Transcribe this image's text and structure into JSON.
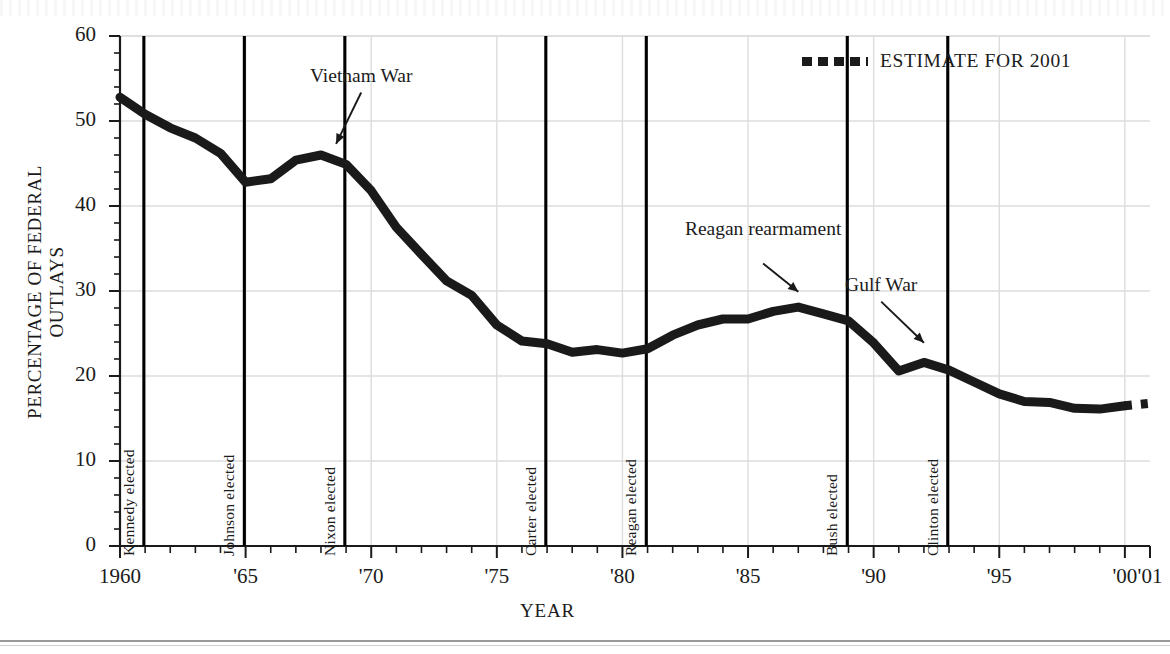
{
  "chart_data": {
    "type": "line",
    "title": "",
    "xlabel": "YEAR",
    "ylabel": "PERCENTAGE OF FEDERAL OUTLAYS",
    "xlim": [
      1960,
      2001
    ],
    "ylim": [
      0,
      60
    ],
    "grid": true,
    "legend_position": "top-right",
    "series": [
      {
        "name": "Defense share of federal outlays",
        "style": "solid",
        "x": [
          1960,
          1961,
          1962,
          1963,
          1964,
          1965,
          1966,
          1967,
          1968,
          1969,
          1970,
          1971,
          1972,
          1973,
          1974,
          1975,
          1976,
          1977,
          1978,
          1979,
          1980,
          1981,
          1982,
          1983,
          1984,
          1985,
          1986,
          1987,
          1988,
          1989,
          1990,
          1991,
          1992,
          1993,
          1994,
          1995,
          1996,
          1997,
          1998,
          1999,
          2000
        ],
        "values": [
          52.8,
          50.8,
          49.2,
          48.0,
          46.2,
          42.8,
          43.2,
          45.4,
          46.0,
          44.9,
          41.8,
          37.5,
          34.3,
          31.2,
          29.5,
          26.0,
          24.1,
          23.8,
          22.8,
          23.1,
          22.7,
          23.2,
          24.8,
          26.0,
          26.7,
          26.7,
          27.6,
          28.1,
          27.3,
          26.5,
          23.9,
          20.6,
          21.6,
          20.7,
          19.3,
          17.9,
          17.0,
          16.9,
          16.2,
          16.1,
          16.5
        ]
      },
      {
        "name": "Estimate for 2001",
        "style": "dotted",
        "x": [
          2000,
          2001
        ],
        "values": [
          16.5,
          16.8
        ]
      }
    ],
    "yticks": [
      0,
      10,
      20,
      30,
      40,
      50,
      60
    ],
    "ytick_labels": [
      "0",
      "10",
      "20",
      "30",
      "40",
      "50",
      "60"
    ],
    "xticks": [
      1960,
      1965,
      1970,
      1975,
      1980,
      1985,
      1990,
      1995,
      2000,
      2001
    ],
    "xtick_labels": [
      "1960",
      "'65",
      "'70",
      "'75",
      "'80",
      "'85",
      "'90",
      "'95",
      "'00",
      "'01"
    ],
    "event_lines": [
      {
        "label": "Kennedy elected",
        "year": 1960.95
      },
      {
        "label": "Johnson elected",
        "year": 1964.95
      },
      {
        "label": "Nixon elected",
        "year": 1968.95
      },
      {
        "label": "Carter elected",
        "year": 1976.95
      },
      {
        "label": "Reagan elected",
        "year": 1980.95
      },
      {
        "label": "Bush elected",
        "year": 1988.95
      },
      {
        "label": "Clinton elected",
        "year": 1992.95
      }
    ],
    "annotations": [
      {
        "text": "Vietnam War",
        "year": 1969.6,
        "value": 55.0,
        "arrow_to_year": 1968.6,
        "arrow_to_value": 46.6
      },
      {
        "text": "Reagan rearmament",
        "year": 1985.6,
        "value": 37.0,
        "arrow_to_year": 1987.0,
        "arrow_to_value": 29.2
      },
      {
        "text": "Gulf War",
        "year": 1990.3,
        "value": 30.4,
        "arrow_to_year": 1992.0,
        "arrow_to_value": 23.2
      }
    ],
    "legend": [
      {
        "label": "ESTIMATE FOR 2001",
        "style": "dotted"
      }
    ],
    "colors": {
      "line": "#1a1a1a",
      "grid": "#dcdcdc",
      "axis": "#1a1a1a",
      "event_line": "#000000"
    }
  }
}
